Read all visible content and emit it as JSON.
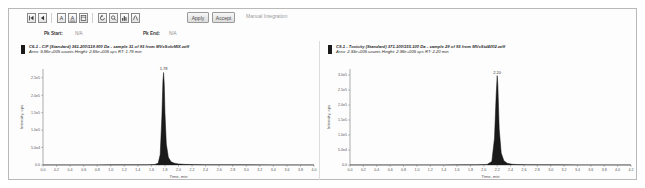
{
  "toolbar": {
    "buttons": [
      {
        "name": "nav-first-icon",
        "glyph": "first"
      },
      {
        "name": "nav-prev-icon",
        "glyph": "prev"
      },
      {
        "name": "annotate-a-icon",
        "glyph": "A"
      },
      {
        "name": "annotate-a-alt-icon",
        "glyph": "A"
      },
      {
        "name": "label-box-icon",
        "glyph": "box"
      },
      {
        "name": "refresh-icon",
        "glyph": "refresh"
      },
      {
        "name": "zoom-region-icon",
        "glyph": "zoom"
      },
      {
        "name": "bar-view-icon",
        "glyph": "bars"
      },
      {
        "name": "smooth-icon",
        "glyph": "wave"
      }
    ],
    "apply_label": "Apply",
    "accept_label": "Accept",
    "manual_integration_label": "Manual Integration"
  },
  "peak_row": {
    "start_label": "Pk Start:",
    "start_value": "N/A",
    "end_label": "Pk End:",
    "end_value": "N/A"
  },
  "panes": [
    {
      "header_line1": "C6-1 - C/F (Standard) 361.200/119.900 Da - sample 31 of 93 from MVxSolvMIX.wiff",
      "header_line2": "Area: 9.86e+005 counts  Height: 2.65e+005 cps  RT: 1.78 min",
      "swatch_color": "#1a1a1a"
    },
    {
      "header_line1": "C9-1 - Toxicity (Standard) 371.100/155.100 Da - sample 29 of 93 from MVxStd4002.wiff",
      "header_line2": "Area: 2.93e+005 counts  Height: 2.98e+005 cps  RT: 2.20 min",
      "swatch_color": "#1a1a1a"
    }
  ],
  "chart_data": [
    {
      "type": "line",
      "title": "C6-1 - C/F (Standard) 361.200/119.900 Da",
      "xlabel": "Time, min",
      "ylabel": "Intensity, cps",
      "xlim": [
        0.0,
        4.0
      ],
      "ylim": [
        0,
        275000
      ],
      "xticks": [
        0.0,
        0.2,
        0.4,
        0.6,
        0.8,
        1.0,
        1.2,
        1.4,
        1.6,
        1.8,
        2.0,
        2.2,
        2.4,
        2.6,
        2.8,
        3.0,
        3.2,
        3.4,
        3.6,
        3.8,
        4.0
      ],
      "xticklabels": [
        "0.0",
        "0.2",
        "0.4",
        "0.6",
        "0.8",
        "1.0",
        "1.2",
        "1.4",
        "1.6",
        "1.8",
        "2.0",
        "2.2",
        "2.4",
        "2.6",
        "2.8",
        "3.0",
        "3.2",
        "3.4",
        "3.6",
        "3.8",
        "4.0"
      ],
      "yticks": [
        0,
        50000,
        100000,
        150000,
        200000,
        250000
      ],
      "yticklabels": [
        "0.0",
        "5.0e4",
        "1.0e5",
        "1.5e5",
        "2.0e5",
        "2.5e5"
      ],
      "grid": false,
      "peak": {
        "rt": 1.78,
        "height": 265000,
        "label": "1.78"
      },
      "series": [
        {
          "name": "XIC",
          "x": [
            0.0,
            0.2,
            0.4,
            0.6,
            0.8,
            1.0,
            1.2,
            1.4,
            1.55,
            1.65,
            1.7,
            1.73,
            1.755,
            1.77,
            1.78,
            1.79,
            1.8,
            1.82,
            1.85,
            1.89,
            1.94,
            2.0,
            2.08,
            2.2,
            2.4,
            2.7,
            3.0,
            3.4,
            3.8,
            4.0
          ],
          "values": [
            300,
            300,
            300,
            350,
            350,
            400,
            400,
            500,
            700,
            1500,
            5000,
            30000,
            140000,
            240000,
            265000,
            230000,
            150000,
            60000,
            22000,
            9000,
            5000,
            3000,
            1800,
            1100,
            700,
            500,
            400,
            350,
            300,
            300
          ]
        }
      ]
    },
    {
      "type": "line",
      "title": "C9-1 - Toxicity (Standard) 371.100/155.100 Da",
      "xlabel": "Time, min",
      "ylabel": "Intensity, cps",
      "xlim": [
        0.0,
        4.2
      ],
      "ylim": [
        0,
        320000
      ],
      "xticks": [
        0.0,
        0.2,
        0.4,
        0.6,
        0.8,
        1.0,
        1.2,
        1.4,
        1.6,
        1.8,
        2.0,
        2.2,
        2.4,
        2.6,
        2.8,
        3.0,
        3.2,
        3.4,
        3.6,
        3.8,
        4.0,
        4.2
      ],
      "xticklabels": [
        "0.0",
        "0.2",
        "0.4",
        "0.6",
        "0.8",
        "1.0",
        "1.2",
        "1.4",
        "1.6",
        "1.8",
        "2.0",
        "2.2",
        "2.4",
        "2.6",
        "2.8",
        "3.0",
        "3.2",
        "3.4",
        "3.6",
        "3.8",
        "4.0",
        "4.2"
      ],
      "yticks": [
        0,
        50000,
        100000,
        150000,
        200000,
        250000,
        300000
      ],
      "yticklabels": [
        "0.0",
        "5.0e4",
        "1.0e5",
        "1.5e5",
        "2.0e5",
        "2.5e5",
        "3.0e5"
      ],
      "grid": false,
      "peak": {
        "rt": 2.2,
        "height": 298000,
        "label": "2.20"
      },
      "series": [
        {
          "name": "XIC",
          "x": [
            0.0,
            0.2,
            0.5,
            0.8,
            1.1,
            1.4,
            1.7,
            1.9,
            2.05,
            2.12,
            2.16,
            2.185,
            2.2,
            2.21,
            2.23,
            2.26,
            2.3,
            2.35,
            2.42,
            2.5,
            2.65,
            2.85,
            3.1,
            3.4,
            3.7,
            4.0,
            4.2
          ],
          "values": [
            300,
            300,
            300,
            350,
            350,
            400,
            500,
            700,
            2000,
            12000,
            90000,
            235000,
            298000,
            265000,
            120000,
            40000,
            14000,
            6000,
            2500,
            1500,
            900,
            600,
            450,
            400,
            350,
            300,
            300
          ]
        }
      ]
    }
  ]
}
